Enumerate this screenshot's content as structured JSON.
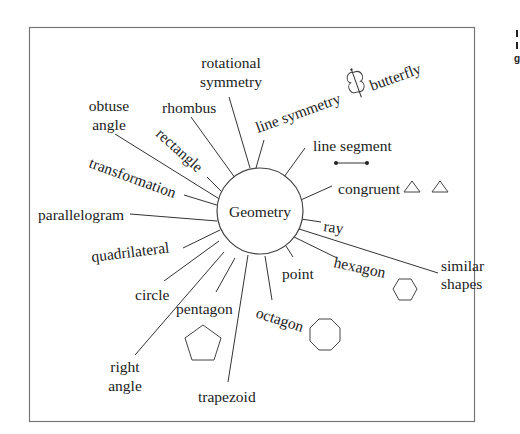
{
  "diagram": {
    "center": {
      "label": "Geometry"
    },
    "spokes": [
      {
        "id": "rotational-symmetry",
        "lines": [
          "rotational",
          "symmetry"
        ]
      },
      {
        "id": "line-symmetry",
        "label": "line symmetry"
      },
      {
        "id": "butterfly",
        "label": "butterfly"
      },
      {
        "id": "line-segment",
        "label": "line segment"
      },
      {
        "id": "congruent",
        "label": "congruent"
      },
      {
        "id": "ray",
        "label": "ray"
      },
      {
        "id": "similar-shapes",
        "lines": [
          "similar",
          "shapes"
        ]
      },
      {
        "id": "hexagon",
        "label": "hexagon"
      },
      {
        "id": "point",
        "label": "point"
      },
      {
        "id": "octagon",
        "label": "octagon"
      },
      {
        "id": "trapezoid",
        "label": "trapezoid"
      },
      {
        "id": "pentagon",
        "label": "pentagon"
      },
      {
        "id": "right-angle",
        "lines": [
          "right",
          "angle"
        ]
      },
      {
        "id": "circle",
        "label": "circle"
      },
      {
        "id": "quadrilateral",
        "label": "quadrilateral"
      },
      {
        "id": "parallelogram",
        "label": "parallelogram"
      },
      {
        "id": "transformation",
        "label": "transformation"
      },
      {
        "id": "rectangle",
        "label": "rectangle"
      },
      {
        "id": "obtuse-angle",
        "lines": [
          "obtuse",
          "angle"
        ]
      },
      {
        "id": "rhombus",
        "label": "rhombus"
      }
    ],
    "icons": [
      "butterfly-icon",
      "line-segment-icon",
      "triangle-icon",
      "triangle-icon",
      "hexagon-icon",
      "octagon-icon",
      "pentagon-icon"
    ],
    "edge_fragments": [
      "I",
      "I",
      "g"
    ]
  }
}
